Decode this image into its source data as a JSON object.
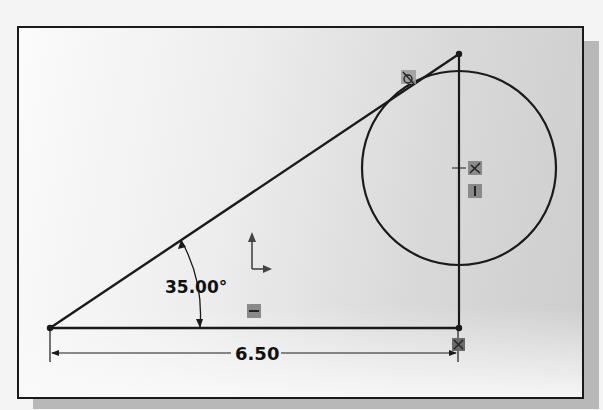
{
  "sketch": {
    "dimensions": {
      "angle_label": "35.00°",
      "length_label": "6.50"
    },
    "relations": [
      {
        "name": "tangent-relation-icon",
        "glyph": "ට"
      },
      {
        "name": "coincident-relation-icon",
        "glyph": "✕"
      },
      {
        "name": "vertical-relation-icon",
        "glyph": "|"
      },
      {
        "name": "horizontal-relation-icon",
        "glyph": "—"
      },
      {
        "name": "coincident-point-relation-icon",
        "glyph": "✕"
      }
    ],
    "icons": {
      "origin": "origin-axes-icon"
    },
    "colors": {
      "line": "#1a1a1a",
      "relation_badge": "#8a8a8a"
    }
  }
}
